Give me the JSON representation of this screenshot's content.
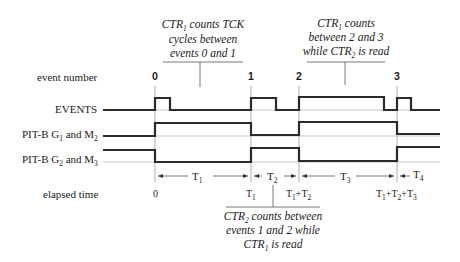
{
  "diagram": {
    "row_labels": {
      "event_number": "event number",
      "events": "EVENTS",
      "pit_g1_prefix": "PIT-B G",
      "pit_g1_sub": "1",
      "pit_g1_mid": " and M",
      "pit_g1_sub2": "2",
      "pit_g2_prefix": "PIT-B G",
      "pit_g2_sub": "2",
      "pit_g2_mid": " and M",
      "pit_g2_sub2": "3",
      "elapsed_time": "elapsed time"
    },
    "event_numbers": [
      "0",
      "1",
      "2",
      "3"
    ],
    "intervals": [
      {
        "base": "T",
        "sub": "1"
      },
      {
        "base": "T",
        "sub": "2"
      },
      {
        "base": "T",
        "sub": "3"
      },
      {
        "base": "T",
        "sub": "4"
      }
    ],
    "elapsed_times": {
      "t0": "0",
      "t1_base": "T",
      "t1_sub": "1",
      "t2_a": "T",
      "t2_a_sub": "1",
      "t2_plus": "+T",
      "t2_b_sub": "2",
      "t3_a": "T",
      "t3_a_sub": "1",
      "t3_plus1": "+T",
      "t3_b_sub": "2",
      "t3_plus2": "+T",
      "t3_c_sub": "3"
    },
    "callouts": {
      "top_left": {
        "line1_a": "CTR",
        "line1_sub": "1",
        "line1_b": " counts TCK",
        "line2": "cycles between",
        "line3": "events 0 and 1"
      },
      "top_right": {
        "line1_a": "CTR",
        "line1_sub": "1",
        "line1_b": " counts",
        "line2": "between 2 and 3",
        "line3_a": "while CTR",
        "line3_sub": "2",
        "line3_b": " is read"
      },
      "bottom": {
        "line1_a": "CTR",
        "line1_sub": "2",
        "line1_b": " counts  between",
        "line2": "events 1 and 2 while",
        "line3_a": "CTR",
        "line3_sub": "1",
        "line3_b": " is read"
      }
    },
    "colors": {
      "trace": "#2a2a2a",
      "reference": "#b8b8b8",
      "text": "#1a1a1a",
      "background": "#ffffff"
    }
  }
}
